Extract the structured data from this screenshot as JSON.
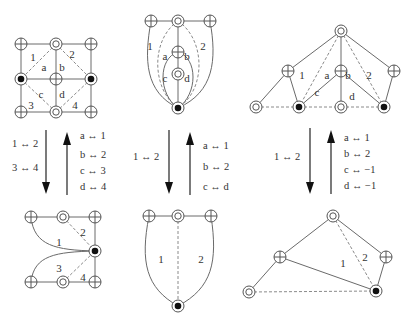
{
  "header": {
    "clipped_caption": ""
  },
  "node_types": {
    "oplus": "circled-plus",
    "odot": "double-circle",
    "bullet": "circled-bullet"
  },
  "diagrams": {
    "top_left": {
      "nodes": [
        {
          "id": "tl",
          "x": 21,
          "y": 44,
          "type": "oplus"
        },
        {
          "id": "tm",
          "x": 56,
          "y": 44,
          "type": "odot"
        },
        {
          "id": "tr",
          "x": 91,
          "y": 44,
          "type": "oplus"
        },
        {
          "id": "ml",
          "x": 21,
          "y": 79,
          "type": "bullet"
        },
        {
          "id": "mm",
          "x": 56,
          "y": 79,
          "type": "oplus"
        },
        {
          "id": "mr",
          "x": 91,
          "y": 79,
          "type": "bullet"
        },
        {
          "id": "bl",
          "x": 21,
          "y": 112,
          "type": "oplus"
        },
        {
          "id": "bm",
          "x": 56,
          "y": 112,
          "type": "odot"
        },
        {
          "id": "br",
          "x": 91,
          "y": 112,
          "type": "oplus"
        }
      ],
      "edges": [
        [
          "tl",
          "tm"
        ],
        [
          "tm",
          "tr"
        ],
        [
          "tl",
          "ml"
        ],
        [
          "tr",
          "mr"
        ],
        [
          "ml",
          "mm"
        ],
        [
          "mm",
          "mr"
        ],
        [
          "tm",
          "mm"
        ],
        [
          "mm",
          "bm"
        ],
        [
          "ml",
          "bl"
        ],
        [
          "mr",
          "br"
        ],
        [
          "bl",
          "bm"
        ],
        [
          "bm",
          "br"
        ]
      ],
      "dashed": [
        [
          "tm",
          "ml"
        ],
        [
          "tm",
          "mr"
        ],
        [
          "ml",
          "bm"
        ],
        [
          "mr",
          "bm"
        ]
      ],
      "labels": [
        {
          "t": "1",
          "x": 33,
          "y": 57
        },
        {
          "t": "2",
          "x": 72,
          "y": 54
        },
        {
          "t": "a",
          "x": 44,
          "y": 67
        },
        {
          "t": "b",
          "x": 62,
          "y": 67
        },
        {
          "t": "c",
          "x": 41,
          "y": 94
        },
        {
          "t": "d",
          "x": 62,
          "y": 94
        },
        {
          "t": "3",
          "x": 31,
          "y": 105
        },
        {
          "t": "4",
          "x": 75,
          "y": 105
        }
      ]
    },
    "top_middle": {
      "nodes": [
        {
          "id": "l",
          "x": 151,
          "y": 21,
          "type": "oplus"
        },
        {
          "id": "m",
          "x": 178,
          "y": 21,
          "type": "odot"
        },
        {
          "id": "r",
          "x": 210,
          "y": 21,
          "type": "oplus"
        },
        {
          "id": "ab",
          "x": 178,
          "y": 52,
          "type": "oplus"
        },
        {
          "id": "cd",
          "x": 178,
          "y": 74,
          "type": "odot"
        },
        {
          "id": "b",
          "x": 178,
          "y": 108,
          "type": "bullet"
        }
      ],
      "labels": [
        {
          "t": "1",
          "x": 150,
          "y": 46
        },
        {
          "t": "2",
          "x": 203,
          "y": 46
        },
        {
          "t": "a",
          "x": 165,
          "y": 56
        },
        {
          "t": "b",
          "x": 187,
          "y": 56
        },
        {
          "t": "c",
          "x": 165,
          "y": 78
        },
        {
          "t": "d",
          "x": 187,
          "y": 78
        }
      ]
    },
    "top_right": {
      "nodes": [
        {
          "id": "top",
          "x": 341,
          "y": 31,
          "type": "odot"
        },
        {
          "id": "l",
          "x": 288,
          "y": 71,
          "type": "oplus"
        },
        {
          "id": "m",
          "x": 341,
          "y": 71,
          "type": "oplus"
        },
        {
          "id": "r",
          "x": 394,
          "y": 71,
          "type": "oplus"
        },
        {
          "id": "bl0",
          "x": 256,
          "y": 107,
          "type": "odot"
        },
        {
          "id": "bl",
          "x": 299,
          "y": 107,
          "type": "bullet"
        },
        {
          "id": "bm",
          "x": 341,
          "y": 107,
          "type": "odot"
        },
        {
          "id": "br",
          "x": 384,
          "y": 107,
          "type": "bullet"
        }
      ],
      "edges": [
        [
          "top",
          "l"
        ],
        [
          "top",
          "m"
        ],
        [
          "top",
          "r"
        ],
        [
          "l",
          "bl0"
        ],
        [
          "l",
          "bl"
        ],
        [
          "m",
          "bl"
        ],
        [
          "m",
          "bm"
        ],
        [
          "m",
          "br"
        ],
        [
          "r",
          "br"
        ]
      ],
      "dashed": [
        [
          "top",
          "bl"
        ],
        [
          "top",
          "br"
        ],
        [
          "bl0",
          "bl"
        ],
        [
          "bl",
          "bm"
        ],
        [
          "bm",
          "br"
        ]
      ],
      "labels": [
        {
          "t": "1",
          "x": 302,
          "y": 75
        },
        {
          "t": "a",
          "x": 327,
          "y": 75
        },
        {
          "t": "b",
          "x": 348,
          "y": 75
        },
        {
          "t": "2",
          "x": 369,
          "y": 75
        },
        {
          "t": "c",
          "x": 317,
          "y": 92
        },
        {
          "t": "d",
          "x": 352,
          "y": 96
        }
      ]
    },
    "bottom_left": {
      "nodes": [
        {
          "id": "tl",
          "x": 31,
          "y": 217,
          "type": "oplus"
        },
        {
          "id": "tm",
          "x": 63,
          "y": 217,
          "type": "odot"
        },
        {
          "id": "tr",
          "x": 95,
          "y": 217,
          "type": "oplus"
        },
        {
          "id": "mr",
          "x": 95,
          "y": 251,
          "type": "bullet"
        },
        {
          "id": "bl",
          "x": 31,
          "y": 282,
          "type": "oplus"
        },
        {
          "id": "bm",
          "x": 63,
          "y": 282,
          "type": "odot"
        },
        {
          "id": "br",
          "x": 95,
          "y": 282,
          "type": "oplus"
        }
      ],
      "labels": [
        {
          "t": "2",
          "x": 83,
          "y": 232
        },
        {
          "t": "1",
          "x": 59,
          "y": 242
        },
        {
          "t": "3",
          "x": 59,
          "y": 268
        },
        {
          "t": "4",
          "x": 83,
          "y": 277
        }
      ]
    },
    "bottom_middle": {
      "nodes": [
        {
          "id": "l",
          "x": 149,
          "y": 216,
          "type": "oplus"
        },
        {
          "id": "m",
          "x": 178,
          "y": 216,
          "type": "odot"
        },
        {
          "id": "r",
          "x": 211,
          "y": 216,
          "type": "oplus"
        },
        {
          "id": "b",
          "x": 178,
          "y": 306,
          "type": "bullet"
        }
      ],
      "labels": [
        {
          "t": "1",
          "x": 161,
          "y": 259
        },
        {
          "t": "2",
          "x": 201,
          "y": 259
        }
      ]
    },
    "bottom_right": {
      "nodes": [
        {
          "id": "top",
          "x": 333,
          "y": 216,
          "type": "odot"
        },
        {
          "id": "l",
          "x": 280,
          "y": 257,
          "type": "oplus"
        },
        {
          "id": "r",
          "x": 386,
          "y": 257,
          "type": "oplus"
        },
        {
          "id": "bl",
          "x": 249,
          "y": 292,
          "type": "odot"
        },
        {
          "id": "b",
          "x": 376,
          "y": 291,
          "type": "bullet"
        }
      ],
      "edges": [
        [
          "top",
          "l"
        ],
        [
          "top",
          "r"
        ],
        [
          "l",
          "bl"
        ],
        [
          "l",
          "b"
        ],
        [
          "r",
          "b"
        ]
      ],
      "dashed": [
        [
          "top",
          "b"
        ],
        [
          "bl",
          "b"
        ]
      ],
      "labels": [
        {
          "t": "1",
          "x": 343,
          "y": 263
        },
        {
          "t": "2",
          "x": 365,
          "y": 257
        }
      ]
    }
  },
  "transitions": {
    "left": {
      "down_maps": [
        "1 ↔ 2",
        "3 ↔ 4"
      ],
      "up_maps": [
        "a ↔ 1",
        "b ↔ 2",
        "c ↔ 3",
        "d ↔ 4"
      ]
    },
    "middle": {
      "down_maps": [
        "1 ↔ 2"
      ],
      "up_maps": [
        "a ↔ 1",
        "b ↔ 2",
        "c ↔ d"
      ]
    },
    "right": {
      "down_maps": [
        "1 ↔ 2"
      ],
      "up_maps": [
        "a ↔ 1",
        "b ↔ 2",
        "c ↔ −1",
        "d ↔ −1"
      ]
    }
  }
}
